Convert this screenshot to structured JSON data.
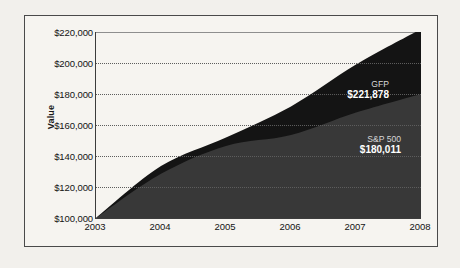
{
  "chart_data": {
    "type": "area",
    "title": "",
    "subtitle": "",
    "xlabel": "",
    "ylabel": "Value",
    "x": [
      2003,
      2004,
      2005,
      2006,
      2007,
      2008
    ],
    "categories": [
      "2003",
      "2004",
      "2005",
      "2006",
      "2007",
      "2008"
    ],
    "xlim": [
      2003,
      2008
    ],
    "ylim": [
      100000,
      220000
    ],
    "y_tick_values": [
      100000,
      120000,
      140000,
      160000,
      180000,
      200000,
      220000
    ],
    "y_tick_labels": [
      "$100,000",
      "$120,000",
      "$140,000",
      "$160,000",
      "$180,000",
      "$200,000",
      "$220,000"
    ],
    "x_tick_labels": [
      "2003",
      "2004",
      "2005",
      "2006",
      "2007",
      "2008"
    ],
    "grid": true,
    "grid_style": "dotted-horizontal",
    "legend_position": "inline-annotation",
    "stacked": false,
    "series": [
      {
        "name": "GFP",
        "color": "#141414",
        "end_label": "$221,878",
        "end_value": 221878,
        "values": [
          100000,
          133500,
          152000,
          172000,
          199000,
          221878
        ]
      },
      {
        "name": "S&P 500",
        "color": "#383838",
        "end_label": "$180,011",
        "end_value": 180011,
        "values": [
          100000,
          128500,
          146500,
          153500,
          168000,
          180011
        ]
      }
    ],
    "annotations": [
      {
        "series": "GFP",
        "label": "GFP",
        "value": "$221,878"
      },
      {
        "series": "S&P 500",
        "label": "S&P 500",
        "value": "$180,011"
      }
    ]
  },
  "axis": {
    "y_title": "Value"
  }
}
